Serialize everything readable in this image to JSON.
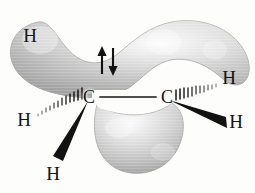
{
  "figure": {
    "molecule": "C2H4",
    "background_color": "#fdfdfc",
    "caption_ghost": "",
    "lobe_color_light": "#f2f2f2",
    "lobe_color_mid": "#c9c9c9",
    "lobe_color_dark": "#9d9d9d",
    "bond_color": "#141414",
    "label_color": "#141414"
  },
  "atoms": {
    "carbons": [
      {
        "id": "carbon-left",
        "label": "C",
        "x": 89,
        "y": 97
      },
      {
        "id": "carbon-right",
        "label": "C",
        "x": 167,
        "y": 97
      }
    ],
    "hydrogens": [
      {
        "id": "hydrogen-upper-left",
        "label": "H",
        "x": 30,
        "y": 35,
        "bond_style": "none",
        "on_lobe": true
      },
      {
        "id": "hydrogen-left-back",
        "label": "H",
        "x": 24,
        "y": 119,
        "bond_style": "hashed-wedge",
        "on_lobe": false
      },
      {
        "id": "hydrogen-lower-left",
        "label": "H",
        "x": 53,
        "y": 173,
        "bond_style": "solid-wedge",
        "on_lobe": false
      },
      {
        "id": "hydrogen-upper-right",
        "label": "H",
        "x": 229,
        "y": 77,
        "bond_style": "hashed-wedge",
        "on_lobe": false
      },
      {
        "id": "hydrogen-lower-right",
        "label": "H",
        "x": 236,
        "y": 121,
        "bond_style": "solid-wedge",
        "on_lobe": false
      }
    ]
  },
  "bonds": {
    "sigma_cc": {
      "label": "C-C sigma bond",
      "x1": 100,
      "y1": 97,
      "x2": 156,
      "y2": 97
    },
    "hashed": [
      {
        "id": "hash-bond-left",
        "from_x": 85,
        "from_y": 100,
        "to_x": 41,
        "to_y": 116,
        "marks": 11
      },
      {
        "id": "hash-bond-right",
        "from_x": 172,
        "from_y": 97,
        "to_x": 217,
        "to_y": 80,
        "marks": 11
      }
    ],
    "wedges": [
      {
        "id": "wedge-bond-lower-left",
        "apex_x": 88,
        "apex_y": 103,
        "tip_x": 58,
        "tip_y": 159,
        "width": 11
      },
      {
        "id": "wedge-bond-lower-right",
        "apex_x": 170,
        "apex_y": 102,
        "tip_x": 226,
        "tip_y": 124,
        "width": 11
      }
    ]
  },
  "orbitals": {
    "pi_upper": {
      "name": "upper-pi-lobe",
      "description": "upper p-orbital lobe of the pi bond"
    },
    "pi_lower": {
      "name": "lower-pi-lobe",
      "description": "lower p-orbital lobe of the pi bond"
    }
  },
  "electrons": {
    "spin_pair": {
      "name": "electron-spin-pair",
      "up_arrow": "spin-up",
      "down_arrow": "spin-down",
      "x": 107,
      "y": 61,
      "count": 2
    }
  }
}
